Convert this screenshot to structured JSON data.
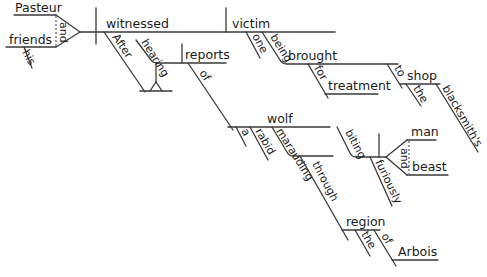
{
  "diagram": {
    "type": "Reed-Kellogg sentence diagram",
    "sentence": "After hearing reports of a rabid wolf marauding through the region of Arbois biting furiously man and beast, Pasteur and his friends witnessed one victim being brought for treatment to the blacksmith's shop.",
    "stroke_color": "#3a3a3a",
    "subject": {
      "compound": [
        "Pasteur",
        "friends"
      ],
      "conjunction": "and",
      "modifiers": {
        "friends": "his"
      }
    },
    "verb": "witnessed",
    "object": "victim",
    "words": {
      "pasteur": "Pasteur",
      "friends": "friends",
      "and1": "and",
      "his": "his",
      "witnessed": "witnessed",
      "victim": "victim",
      "one": "one",
      "being": "being",
      "brought": "brought",
      "for": "for",
      "treatment": "treatment",
      "to": "to",
      "shop": "shop",
      "the1": "the",
      "blacksmiths": "blacksmith's",
      "after": "After",
      "hearing": "hearing",
      "reports": "reports",
      "of1": "of",
      "wolf": "wolf",
      "a": "a",
      "rabid": "rabid",
      "marauding": "marauding",
      "through": "through",
      "region": "region",
      "the2": "the",
      "of2": "of",
      "arbois": "Arbois",
      "biting": "biting",
      "furiously": "furiously",
      "man": "man",
      "and2": "and",
      "beast": "beast"
    }
  }
}
